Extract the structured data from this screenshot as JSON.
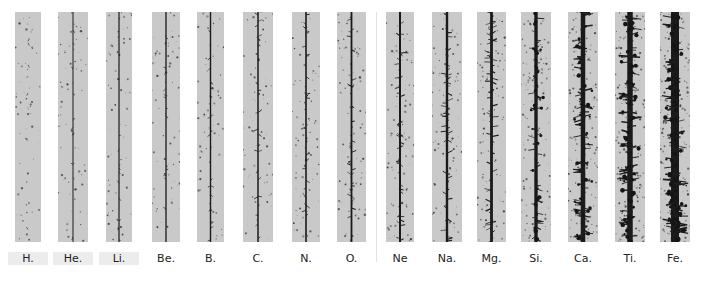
{
  "figure": {
    "separator_x": 376,
    "strips": [
      {
        "element": "H.",
        "x": 15,
        "w": 26,
        "density": 0.05,
        "core": 0.0,
        "dots": 60
      },
      {
        "element": "He.",
        "x": 58,
        "w": 30,
        "density": 0.1,
        "core": 1.0,
        "dots": 70
      },
      {
        "element": "Li.",
        "x": 106,
        "w": 26,
        "density": 0.12,
        "core": 1.2,
        "dots": 60
      },
      {
        "element": "Be.",
        "x": 152,
        "w": 28,
        "density": 0.15,
        "core": 1.3,
        "dots": 65
      },
      {
        "element": "B.",
        "x": 197,
        "w": 27,
        "density": 0.18,
        "core": 1.4,
        "dots": 60
      },
      {
        "element": "C.",
        "x": 243,
        "w": 30,
        "density": 0.22,
        "core": 1.5,
        "dots": 70
      },
      {
        "element": "N.",
        "x": 292,
        "w": 28,
        "density": 0.26,
        "core": 1.6,
        "dots": 70
      },
      {
        "element": "O.",
        "x": 337,
        "w": 29,
        "density": 0.3,
        "core": 1.8,
        "dots": 80
      },
      {
        "element": "Ne",
        "x": 386,
        "w": 28,
        "density": 0.36,
        "core": 2.0,
        "dots": 80
      },
      {
        "element": "Na.",
        "x": 432,
        "w": 30,
        "density": 0.42,
        "core": 2.4,
        "dots": 90
      },
      {
        "element": "Mg.",
        "x": 477,
        "w": 29,
        "density": 0.48,
        "core": 2.8,
        "dots": 100
      },
      {
        "element": "Si.",
        "x": 521,
        "w": 30,
        "density": 0.55,
        "core": 3.4,
        "dots": 110
      },
      {
        "element": "Ca.",
        "x": 568,
        "w": 30,
        "density": 0.7,
        "core": 4.5,
        "dots": 150
      },
      {
        "element": "Ti.",
        "x": 615,
        "w": 30,
        "density": 0.8,
        "core": 5.5,
        "dots": 170
      },
      {
        "element": "Fe.",
        "x": 660,
        "w": 30,
        "density": 0.95,
        "core": 8.0,
        "dots": 220
      }
    ]
  }
}
